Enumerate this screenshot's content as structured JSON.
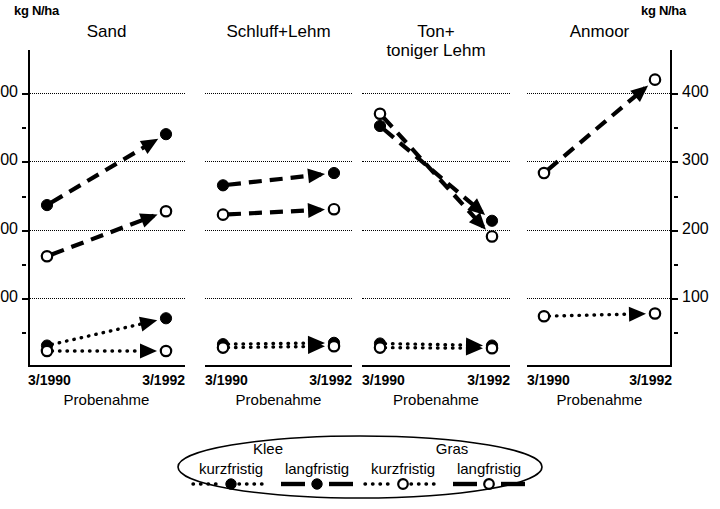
{
  "axis": {
    "unit_left": "kg N/ha",
    "unit_right": "kg N/ha",
    "yticks": [
      400,
      300,
      200,
      100
    ],
    "xticks": [
      "3/1990",
      "3/1992"
    ],
    "xtitle": "Probenahme"
  },
  "legend": {
    "groups": [
      "Klee",
      "Gras"
    ],
    "items": [
      {
        "label": "kurzfristig",
        "marker": "filled-circle-dotted"
      },
      {
        "label": "langfristig",
        "marker": "filled-circle-dashed"
      },
      {
        "label": "kurzfristig",
        "marker": "open-circle-dotted"
      },
      {
        "label": "langfristig",
        "marker": "open-circle-dashed"
      }
    ]
  },
  "chart_data": {
    "type": "line",
    "title": "",
    "xlabel": "Probenahme",
    "ylabel": "kg N/ha",
    "ylim": [
      0,
      440
    ],
    "yticks": [
      100,
      200,
      300,
      400
    ],
    "x": [
      "3/1990",
      "3/1992"
    ],
    "grid": true,
    "legend_position": "bottom",
    "panels": [
      {
        "name": "Sand",
        "series": [
          {
            "name": "Klee langfristig",
            "marker": "filled-circle",
            "line": "dashed",
            "values": [
              236,
              340
            ]
          },
          {
            "name": "Gras langfristig",
            "marker": "open-circle",
            "line": "dashed",
            "values": [
              161,
              227
            ]
          },
          {
            "name": "Klee kurzfristig",
            "marker": "filled-circle",
            "line": "dotted",
            "values": [
              30,
              70
            ]
          },
          {
            "name": "Gras kurzfristig",
            "marker": "open-circle",
            "line": "dotted",
            "values": [
              22,
              22
            ]
          }
        ]
      },
      {
        "name": "Schluff+Lehm",
        "series": [
          {
            "name": "Klee langfristig",
            "marker": "filled-circle",
            "line": "dashed",
            "values": [
              265,
              283
            ]
          },
          {
            "name": "Gras langfristig",
            "marker": "open-circle",
            "line": "dashed",
            "values": [
              222,
              230
            ]
          },
          {
            "name": "Klee kurzfristig",
            "marker": "filled-circle",
            "line": "dotted",
            "values": [
              32,
              34
            ]
          },
          {
            "name": "Gras kurzfristig",
            "marker": "open-circle",
            "line": "dotted",
            "values": [
              27,
              29
            ]
          }
        ]
      },
      {
        "name": "Ton+\ntoniger Lehm",
        "series": [
          {
            "name": "Klee langfristig",
            "marker": "filled-circle",
            "line": "dashed",
            "values": [
              352,
              213
            ]
          },
          {
            "name": "Gras langfristig",
            "marker": "open-circle",
            "line": "dashed",
            "values": [
              370,
              190
            ]
          },
          {
            "name": "Klee kurzfristig",
            "marker": "filled-circle",
            "line": "dotted",
            "values": [
              33,
              30
            ]
          },
          {
            "name": "Gras kurzfristig",
            "marker": "open-circle",
            "line": "dotted",
            "values": [
              27,
              26
            ]
          }
        ]
      },
      {
        "name": "Anmoor",
        "series": [
          {
            "name": "Gras langfristig",
            "marker": "open-circle",
            "line": "dashed",
            "values": [
              283,
              420
            ]
          },
          {
            "name": "Gras kurzfristig",
            "marker": "open-circle",
            "line": "dotted",
            "values": [
              73,
              77
            ]
          }
        ]
      }
    ]
  }
}
